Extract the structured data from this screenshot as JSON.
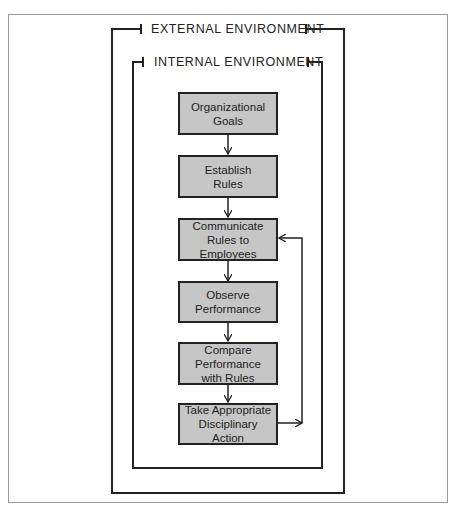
{
  "diagram": {
    "outer_label": "EXTERNAL ENVIRONMENT",
    "inner_label": "INTERNAL ENVIRONMENT",
    "steps": [
      {
        "label": "Organizational Goals"
      },
      {
        "label": "Establish Rules"
      },
      {
        "label": "Communicate Rules to Employees"
      },
      {
        "label": "Observe Performance"
      },
      {
        "label": "Compare Performance with Rules"
      },
      {
        "label": "Take Appropriate Disciplinary Action"
      }
    ],
    "feedback": {
      "from": "Take Appropriate Disciplinary Action",
      "to": "Communicate Rules to Employees"
    },
    "colors": {
      "box_fill": "#c6c6c6",
      "line": "#222222",
      "page_border": "#9a9a9a"
    }
  }
}
